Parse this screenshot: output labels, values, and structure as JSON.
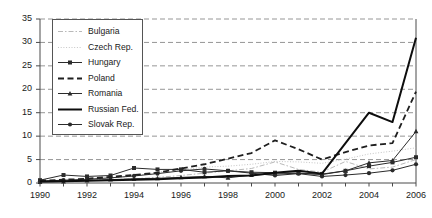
{
  "chart_data": {
    "type": "line",
    "title": "",
    "xlabel": "",
    "ylabel": "",
    "x": [
      1990,
      1991,
      1992,
      1993,
      1994,
      1995,
      1996,
      1997,
      1998,
      1999,
      2000,
      2001,
      2002,
      2003,
      2004,
      2005,
      2006
    ],
    "xlim": [
      1990,
      2006
    ],
    "ylim": [
      0,
      35
    ],
    "yticks": [
      0,
      5,
      10,
      15,
      20,
      25,
      30,
      35
    ],
    "xticks": [
      1990,
      1992,
      1994,
      1996,
      1998,
      2000,
      2002,
      2004,
      2006
    ],
    "xtick_labels": [
      "1990",
      "1992",
      "1994",
      "1996",
      "1998",
      "2000",
      "2002",
      "2004",
      "2006"
    ],
    "ytick_labels": [
      "0",
      "5",
      "10",
      "15",
      "20",
      "25",
      "30",
      "35"
    ],
    "grid": "horizontal-dashed",
    "legend_position": "upper-left-inside",
    "series": [
      {
        "name": "Bulgaria",
        "style": "dashdot",
        "color": "#b9b9b9",
        "width": 1.0,
        "marker": "none",
        "values": [
          0.4,
          0.5,
          0.6,
          0.7,
          0.9,
          1.2,
          1.6,
          2.1,
          2.6,
          3.1,
          4.5,
          2.9,
          2.3,
          4.6,
          3.0,
          3.4,
          5.0
        ]
      },
      {
        "name": "Czech Rep.",
        "style": "dotted",
        "color": "#c6c6c6",
        "width": 1.0,
        "marker": "none",
        "values": [
          0.3,
          0.4,
          0.6,
          1.0,
          1.5,
          2.3,
          2.8,
          3.4,
          3.6,
          4.0,
          4.6,
          4.5,
          4.2,
          5.1,
          6.2,
          6.8,
          7.5
        ]
      },
      {
        "name": "Hungary",
        "style": "solid",
        "color": "#2b2b2b",
        "width": 1.0,
        "marker": "square",
        "values": [
          0.6,
          1.7,
          1.4,
          1.6,
          3.2,
          2.9,
          2.9,
          2.3,
          2.6,
          2.3,
          2.2,
          2.1,
          1.9,
          2.6,
          3.6,
          4.4,
          5.5
        ]
      },
      {
        "name": "Poland",
        "style": "dashed",
        "color": "#1f1f1f",
        "width": 1.8,
        "marker": "none",
        "values": [
          0.5,
          0.7,
          0.9,
          1.3,
          1.7,
          2.2,
          3.1,
          4.0,
          5.2,
          6.4,
          9.1,
          7.2,
          5.0,
          6.6,
          8.0,
          8.5,
          19.5
        ]
      },
      {
        "name": "Romania",
        "style": "solid",
        "color": "#2b2b2b",
        "width": 1.0,
        "marker": "triangle",
        "values": [
          0.2,
          0.3,
          0.5,
          0.7,
          0.9,
          1.0,
          1.2,
          1.4,
          1.1,
          1.7,
          1.9,
          2.1,
          1.8,
          2.6,
          4.3,
          4.8,
          11.0
        ]
      },
      {
        "name": "Russian Fed.",
        "style": "solid",
        "color": "#0d0d0d",
        "width": 2.0,
        "marker": "none",
        "values": [
          0.3,
          0.4,
          0.5,
          0.6,
          0.7,
          0.8,
          1.0,
          1.2,
          1.5,
          1.6,
          2.2,
          2.6,
          2.0,
          8.5,
          15.0,
          13.0,
          31.0
        ]
      },
      {
        "name": "Slovak Rep.",
        "style": "solid",
        "color": "#2b2b2b",
        "width": 1.0,
        "marker": "circle",
        "values": [
          0.4,
          0.6,
          0.8,
          1.1,
          1.5,
          2.0,
          2.6,
          3.0,
          2.6,
          2.1,
          1.6,
          2.0,
          1.4,
          1.7,
          2.1,
          2.7,
          4.0
        ]
      }
    ],
    "legend_entries": [
      "Bulgaria",
      "Czech Rep.",
      "Hungary",
      "Poland",
      "Romania",
      "Russian Fed.",
      "Slovak Rep."
    ]
  }
}
